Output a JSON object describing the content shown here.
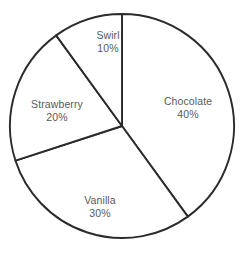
{
  "chart_data": {
    "type": "pie",
    "title": "",
    "subtitle": "",
    "xlabel": "",
    "ylabel": "",
    "legend": "none",
    "grid": false,
    "labels_inside_slices": true,
    "start_angle_deg": 0,
    "direction": "clockwise",
    "categories": [
      "Chocolate",
      "Vanilla",
      "Strawberry",
      "Swirl"
    ],
    "values": [
      40,
      30,
      20,
      10
    ],
    "value_unit": "%",
    "slices": [
      {
        "name": "Chocolate",
        "value": 40,
        "value_text": "40%",
        "start_deg": 0,
        "end_deg": 144,
        "fill": "#ffffff",
        "label_x": 188,
        "label_y": 108
      },
      {
        "name": "Vanilla",
        "value": 30,
        "value_text": "30%",
        "start_deg": 144,
        "end_deg": 252,
        "fill": "#ffffff",
        "label_x": 100,
        "label_y": 207
      },
      {
        "name": "Strawberry",
        "value": 20,
        "value_text": "20%",
        "start_deg": 252,
        "end_deg": 324,
        "fill": "#ffffff",
        "label_x": 57,
        "label_y": 111
      },
      {
        "name": "Swirl",
        "value": 10,
        "value_text": "10%",
        "start_deg": 324,
        "end_deg": 360,
        "fill": "#ffffff",
        "label_x": 108,
        "label_y": 42
      }
    ],
    "geometry": {
      "center_x": 122,
      "center_y": 126,
      "radius": 112
    },
    "style": {
      "background": "#ffffff",
      "stroke": "#2b2b2b",
      "stroke_width": 1.9,
      "label_color": "#595959"
    }
  }
}
